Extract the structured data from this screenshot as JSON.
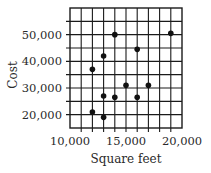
{
  "chart_data": {
    "type": "scatter",
    "title": "",
    "xlabel": "Square feet",
    "ylabel": "Cost",
    "xlim": [
      10000,
      20000
    ],
    "ylim": [
      15000,
      60000
    ],
    "x_ticks": [
      10000,
      15000,
      20000
    ],
    "x_tick_labels": [
      "10,000",
      "15,000",
      "20,000"
    ],
    "y_ticks": [
      20000,
      30000,
      40000,
      50000
    ],
    "y_tick_labels": [
      "20,000",
      "30,000",
      "40,000",
      "50,000"
    ],
    "grid": true,
    "x_grid_step": 1000,
    "y_grid_step": 5000,
    "legend": null,
    "points": [
      {
        "x": 12000,
        "y": 21000
      },
      {
        "x": 12000,
        "y": 37000
      },
      {
        "x": 13000,
        "y": 19000
      },
      {
        "x": 13000,
        "y": 27000
      },
      {
        "x": 13000,
        "y": 42000
      },
      {
        "x": 14000,
        "y": 26500
      },
      {
        "x": 14000,
        "y": 50000
      },
      {
        "x": 15000,
        "y": 31000
      },
      {
        "x": 16000,
        "y": 26500
      },
      {
        "x": 16000,
        "y": 44500
      },
      {
        "x": 17000,
        "y": 31000
      },
      {
        "x": 19000,
        "y": 50500
      }
    ],
    "colors": {
      "grid": "#1a1a1a",
      "point": "#111111",
      "text": "#2a2a2a"
    }
  }
}
